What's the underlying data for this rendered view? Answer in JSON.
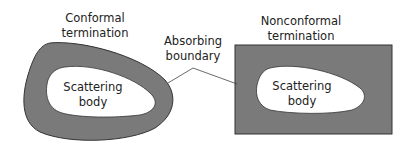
{
  "diagram": {
    "left": {
      "title_line1": "Conformal",
      "title_line2": "termination",
      "body_line1": "Scattering",
      "body_line2": "body"
    },
    "center": {
      "label_line1": "Absorbing",
      "label_line2": "boundary"
    },
    "right": {
      "title_line1": "Nonconformal",
      "title_line2": "termination",
      "body_line1": "Scattering",
      "body_line2": "body"
    },
    "colors": {
      "boundary_fill": "#7a7a7a",
      "boundary_stroke": "#333333",
      "body_fill": "#ffffff",
      "leader_line": "#444444"
    }
  }
}
